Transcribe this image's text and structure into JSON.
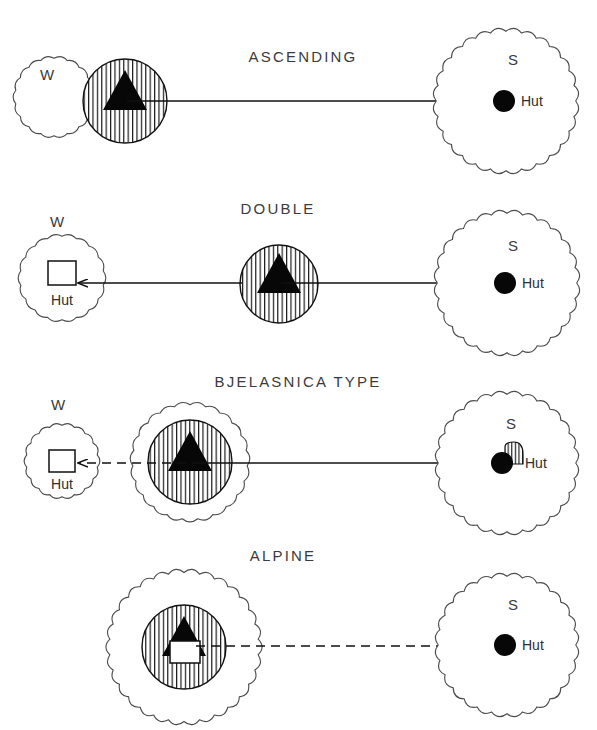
{
  "figure": {
    "title": "",
    "background_color": "#ffffff",
    "ink_color": "#111111",
    "label_color": "#3b3b3b",
    "width": 597,
    "height": 730
  },
  "legend_symbols": {
    "triangle": "summer-pasture-triangle",
    "black-dot": "permanent-settlement-dot",
    "white-square": "hut-square",
    "hatched-circle": "hatched-zone-circle",
    "scalloped-circle": "scalloped-zone-circle"
  },
  "rows": [
    {
      "id": "ascending",
      "title": "ASCENDING",
      "title_x": 303,
      "title_y": 62,
      "axis_y": 101,
      "west": {
        "label": "W",
        "label_x": 47,
        "label_y": 80,
        "cx": 54,
        "cy": 97,
        "r": 41,
        "style": "scalloped",
        "inner_symbol": "none",
        "hut_label": ""
      },
      "middle": {
        "cx": 125,
        "cy": 101,
        "r": 42,
        "style": "hatched",
        "outer_r": 0,
        "triangle": true,
        "square": false
      },
      "south": {
        "label": "S",
        "label_x": 513,
        "label_y": 65,
        "cx": 506,
        "cy": 101,
        "r": 73,
        "style": "scalloped",
        "dot_cx": 504,
        "dot_cy": 101,
        "dot_r": 11,
        "hut_label": "Hut",
        "hut_x": 521,
        "hut_y": 106,
        "small_hatch": false
      },
      "arrows": [
        {
          "x1": 127,
          "y1": 101,
          "x2": 498,
          "y2": 101,
          "dashed": false,
          "head_right": true,
          "head_left": false
        }
      ]
    },
    {
      "id": "double",
      "title": "DOUBLE",
      "title_x": 278,
      "title_y": 214,
      "axis_y": 283,
      "west": {
        "label": "W",
        "label_x": 57,
        "label_y": 227,
        "cx": 62,
        "cy": 278,
        "r": 44,
        "style": "scalloped",
        "inner_symbol": "square",
        "square_x": 48,
        "square_y": 261,
        "square_w": 28,
        "square_h": 24,
        "hut_label": "Hut",
        "hut_x": 62,
        "hut_y": 305
      },
      "middle": {
        "cx": 279,
        "cy": 284,
        "r": 39,
        "style": "hatched",
        "outer_r": 0,
        "triangle": true,
        "square": false
      },
      "south": {
        "label": "S",
        "label_x": 513,
        "label_y": 251,
        "cx": 507,
        "cy": 283,
        "r": 73,
        "style": "scalloped",
        "dot_cx": 505,
        "dot_cy": 283,
        "dot_r": 11,
        "hut_label": "Hut",
        "hut_x": 522,
        "hut_y": 288,
        "small_hatch": false
      },
      "arrows": [
        {
          "x1": 242,
          "y1": 283,
          "x2": 78,
          "y2": 283,
          "dashed": false,
          "head_right": false,
          "head_left": true
        },
        {
          "x1": 281,
          "y1": 283,
          "x2": 499,
          "y2": 283,
          "dashed": false,
          "head_right": true,
          "head_left": false
        }
      ]
    },
    {
      "id": "bjelasnica",
      "title": "BJELASNICA TYPE",
      "title_x": 298,
      "title_y": 387,
      "axis_y": 463,
      "west": {
        "label": "W",
        "label_x": 58,
        "label_y": 410,
        "cx": 62,
        "cy": 461,
        "r": 38,
        "style": "scalloped",
        "inner_symbol": "square",
        "square_x": 49,
        "square_y": 450,
        "square_w": 26,
        "square_h": 22,
        "hut_label": "Hut",
        "hut_x": 62,
        "hut_y": 489
      },
      "middle": {
        "cx": 190,
        "cy": 462,
        "r": 42,
        "style": "hatched",
        "outer_r": 60,
        "triangle": true,
        "square": false
      },
      "south": {
        "label": "S",
        "label_x": 511,
        "label_y": 429,
        "cx": 507,
        "cy": 463,
        "r": 72,
        "style": "scalloped",
        "dot_cx": 502,
        "dot_cy": 463,
        "dot_r": 11,
        "hut_label": "Hut",
        "hut_x": 525,
        "hut_y": 468,
        "small_hatch": true,
        "small_hatch_x": 505,
        "small_hatch_y": 442,
        "small_hatch_w": 18,
        "small_hatch_h": 22
      },
      "arrows": [
        {
          "x1": 186,
          "y1": 463,
          "x2": 78,
          "y2": 463,
          "dashed": true,
          "head_right": false,
          "head_left": true
        },
        {
          "x1": 192,
          "y1": 463,
          "x2": 496,
          "y2": 463,
          "dashed": false,
          "head_right": true,
          "head_left": false
        }
      ]
    },
    {
      "id": "alpine",
      "title": "ALPINE",
      "title_x": 283,
      "title_y": 561,
      "axis_y": 646,
      "west": null,
      "middle": {
        "cx": 184,
        "cy": 647,
        "r": 42,
        "style": "hatched",
        "outer_r": 78,
        "triangle": true,
        "square": true,
        "square_x": 170,
        "square_y": 641,
        "square_w": 30,
        "square_h": 22
      },
      "south": {
        "label": "S",
        "label_x": 513,
        "label_y": 610,
        "cx": 507,
        "cy": 645,
        "r": 72,
        "style": "scalloped",
        "dot_cx": 505,
        "dot_cy": 645,
        "dot_r": 11,
        "hut_label": "Hut",
        "hut_x": 522,
        "hut_y": 650,
        "small_hatch": false
      },
      "arrows": [
        {
          "x1": 196,
          "y1": 646,
          "x2": 498,
          "y2": 646,
          "dashed": true,
          "head_right": true,
          "head_left": false
        }
      ]
    }
  ]
}
